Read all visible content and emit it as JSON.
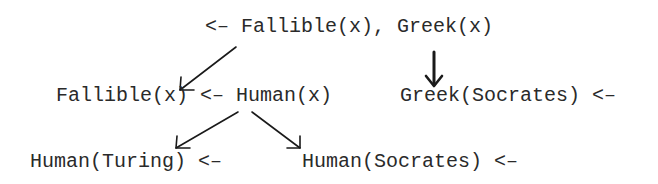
{
  "diagram": {
    "type": "resolution-tree",
    "nodes": [
      {
        "id": "root",
        "text": "<– Fallible(x), Greek(x)"
      },
      {
        "id": "fallible_rule",
        "text": "Fallible(x) <– Human(x)"
      },
      {
        "id": "greek_fact",
        "text": "Greek(Socrates) <–"
      },
      {
        "id": "human_turing",
        "text": "Human(Turing) <–"
      },
      {
        "id": "human_socrates",
        "text": "Human(Socrates) <–"
      }
    ],
    "edges": [
      {
        "from": "root",
        "to": "fallible_rule"
      },
      {
        "from": "root",
        "to": "greek_fact"
      },
      {
        "from": "fallible_rule",
        "to": "human_turing"
      },
      {
        "from": "fallible_rule",
        "to": "human_socrates"
      }
    ],
    "colors": {
      "text": "#2a2a2a",
      "arrow": "#1a1a1a",
      "background": "#ffffff"
    }
  }
}
